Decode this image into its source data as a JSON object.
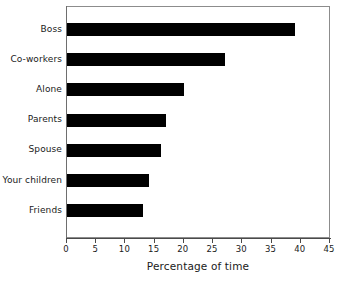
{
  "chart_data": {
    "type": "bar",
    "orientation": "horizontal",
    "title": "",
    "xlabel": "Percentage of time",
    "ylabel": "",
    "categories": [
      "Boss",
      "Co-workers",
      "Alone",
      "Parents",
      "Spouse",
      "Your children",
      "Friends"
    ],
    "values": [
      39,
      27,
      20,
      17,
      16,
      14,
      13
    ],
    "xlim": [
      0,
      45
    ],
    "xticks": [
      0,
      5,
      10,
      15,
      20,
      25,
      30,
      35,
      40,
      45
    ],
    "xtick_labels": [
      "0",
      "5",
      "10",
      "15",
      "20",
      "25",
      "30",
      "35",
      "40",
      "45"
    ],
    "grid": false,
    "legend": false,
    "bar_color": "#000000",
    "frame_color": "#8c8c8c",
    "text_color": "#1a1a1a"
  }
}
